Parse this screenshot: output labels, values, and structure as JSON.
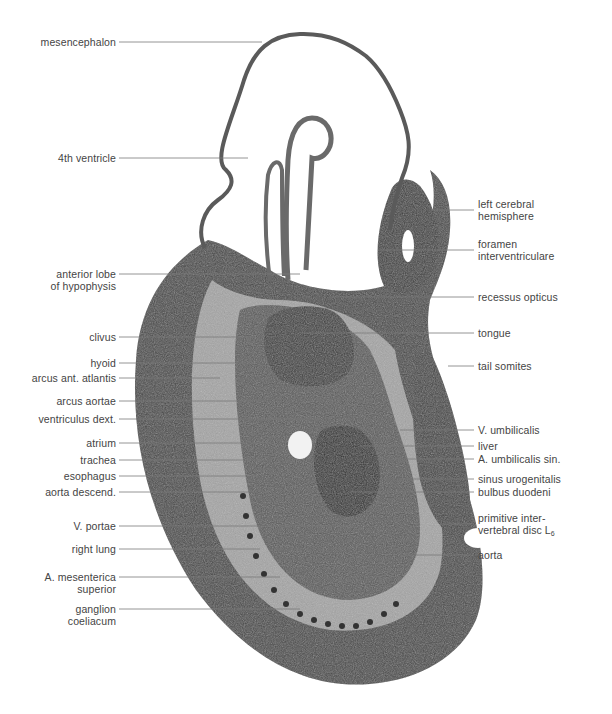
{
  "figure": {
    "colors": {
      "tissue_dark": "#3d3d3d",
      "tissue_mid": "#6b6b6b",
      "tissue_light": "#bdbdbd",
      "cavity": "#ffffff",
      "leader": "#7a7a7a",
      "label_text": "#444444"
    }
  },
  "labels_left": [
    {
      "id": "mesencephalon",
      "text": "mesencephalon",
      "x2": 262,
      "y": 42
    },
    {
      "id": "4th-ventricle",
      "text": "4th ventricle",
      "x2": 248,
      "y": 158
    },
    {
      "id": "anterior-lobe-of-hypophysis",
      "text": "anterior lobe",
      "text2": "of hypophysis",
      "x2": 300,
      "y": 274
    },
    {
      "id": "clivus",
      "text": "clivus",
      "x2": 255,
      "y": 337
    },
    {
      "id": "hyoid",
      "text": "hyoid",
      "x2": 256,
      "y": 363
    },
    {
      "id": "arcus-ant-atlantis",
      "text": "arcus ant. atlantis",
      "x2": 220,
      "y": 378
    },
    {
      "id": "arcus-aortae",
      "text": "arcus aortae",
      "x2": 268,
      "y": 401
    },
    {
      "id": "ventriculus-dext",
      "text": "ventriculus dext.",
      "x2": 320,
      "y": 419
    },
    {
      "id": "atrium",
      "text": "atrium",
      "x2": 272,
      "y": 443
    },
    {
      "id": "trachea",
      "text": "trachea",
      "x2": 266,
      "y": 460
    },
    {
      "id": "esophagus",
      "text": "esophagus",
      "x2": 258,
      "y": 476
    },
    {
      "id": "aorta-descend",
      "text": "aorta descend.",
      "x2": 254,
      "y": 492
    },
    {
      "id": "v-portae",
      "text": "V. portae",
      "x2": 352,
      "y": 526
    },
    {
      "id": "right-lung",
      "text": "right lung",
      "x2": 260,
      "y": 549
    },
    {
      "id": "a-mesenterica-superior",
      "text": "A. mesenterica",
      "text2": "superior",
      "x2": 280,
      "y": 577
    },
    {
      "id": "ganglion-coeliacum",
      "text": "ganglion",
      "text2": "coeliacum",
      "x2": 300,
      "y": 609
    }
  ],
  "labels_right": [
    {
      "id": "left-cerebral-hemisphere",
      "text": "left cerebral",
      "text2": "hemisphere",
      "x1": 432,
      "y": 210
    },
    {
      "id": "foramen-interventriculare",
      "text": "foramen",
      "text2": "interventriculare",
      "x1": 380,
      "y": 250
    },
    {
      "id": "recessus-opticus",
      "text": "recessus opticus",
      "x1": 330,
      "y": 297
    },
    {
      "id": "tongue",
      "text": "tongue",
      "x1": 300,
      "y": 333
    },
    {
      "id": "tail-somites",
      "text": "tail somites",
      "x1": 448,
      "y": 366
    },
    {
      "id": "v-umbilicalis",
      "text": "V. umbilicalis",
      "x1": 400,
      "y": 430
    },
    {
      "id": "liver",
      "text": "liver",
      "x1": 360,
      "y": 446
    },
    {
      "id": "a-umbilicalis-sin",
      "text": "A. umbilicalis sin.",
      "x1": 392,
      "y": 459
    },
    {
      "id": "sinus-urogenitalis",
      "text": "sinus urogenitalis",
      "x1": 400,
      "y": 479
    },
    {
      "id": "bulbus-duodeni",
      "text": "bulbus duodeni",
      "x1": 350,
      "y": 492
    },
    {
      "id": "primitive-intervertebral-disc",
      "text": "primitive inter-",
      "text2": "vertebral disc L",
      "sub": "6",
      "x1": 440,
      "y": 524
    },
    {
      "id": "aorta",
      "text": "aorta",
      "x1": 400,
      "y": 555
    }
  ]
}
